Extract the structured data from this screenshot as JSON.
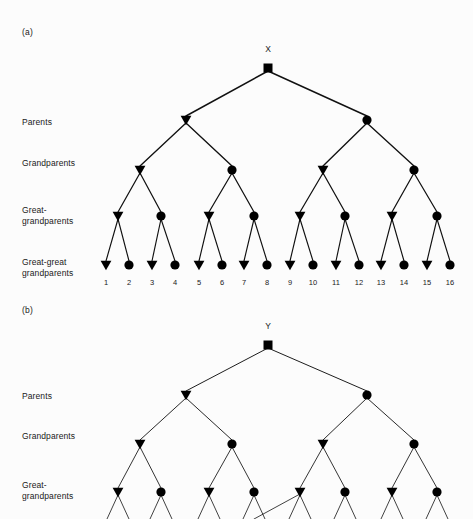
{
  "figure": {
    "background": "#fcfcfc",
    "ink": "#000000",
    "width": 473,
    "height": 519,
    "type": "pedigree-diagram"
  },
  "generation_labels": {
    "parents": "Parents",
    "grandparents": "Grandparents",
    "great_grandparents_line1": "Great-",
    "great_grandparents_line2": "grandparents",
    "great_great_grandparents_line1": "Great-great",
    "great_great_grandparents_line2": "grandparents"
  },
  "symbols": {
    "proband": "square",
    "male": "triangle-down",
    "female": "circle"
  },
  "panel_a": {
    "tag": "(a)",
    "proband_label": "X",
    "leaf_numbers": [
      "1",
      "2",
      "3",
      "4",
      "5",
      "6",
      "7",
      "8",
      "9",
      "10",
      "11",
      "12",
      "13",
      "14",
      "15",
      "16"
    ],
    "levels": [
      {
        "name": "proband",
        "y": 68,
        "nodes": [
          {
            "x": 268,
            "shape": "square"
          }
        ]
      },
      {
        "name": "parents",
        "y": 120,
        "nodes": [
          {
            "x": 186,
            "shape": "triangle"
          },
          {
            "x": 367,
            "shape": "circle"
          }
        ]
      },
      {
        "name": "grandparents",
        "y": 170,
        "nodes": [
          {
            "x": 140,
            "shape": "triangle"
          },
          {
            "x": 232,
            "shape": "circle"
          },
          {
            "x": 323,
            "shape": "triangle"
          },
          {
            "x": 414,
            "shape": "circle"
          }
        ]
      },
      {
        "name": "great-grandparents",
        "y": 216,
        "nodes": [
          {
            "x": 118,
            "shape": "triangle"
          },
          {
            "x": 161,
            "shape": "circle"
          },
          {
            "x": 209,
            "shape": "triangle"
          },
          {
            "x": 254,
            "shape": "circle"
          },
          {
            "x": 300,
            "shape": "triangle"
          },
          {
            "x": 345,
            "shape": "circle"
          },
          {
            "x": 392,
            "shape": "triangle"
          },
          {
            "x": 437,
            "shape": "circle"
          }
        ]
      },
      {
        "name": "great-great-grandparents",
        "y": 265,
        "nodes": [
          {
            "x": 106,
            "shape": "triangle"
          },
          {
            "x": 129,
            "shape": "circle"
          },
          {
            "x": 152,
            "shape": "triangle"
          },
          {
            "x": 175,
            "shape": "circle"
          },
          {
            "x": 199,
            "shape": "triangle"
          },
          {
            "x": 222,
            "shape": "circle"
          },
          {
            "x": 244,
            "shape": "triangle"
          },
          {
            "x": 267,
            "shape": "circle"
          },
          {
            "x": 290,
            "shape": "triangle"
          },
          {
            "x": 313,
            "shape": "circle"
          },
          {
            "x": 336,
            "shape": "triangle"
          },
          {
            "x": 359,
            "shape": "circle"
          },
          {
            "x": 381,
            "shape": "triangle"
          },
          {
            "x": 404,
            "shape": "circle"
          },
          {
            "x": 427,
            "shape": "triangle"
          },
          {
            "x": 450,
            "shape": "circle"
          }
        ]
      }
    ],
    "label_positions": {
      "tag_x": 22,
      "tag_y": 33,
      "parents_y": 118,
      "grandparents_y": 159,
      "great_y": 206,
      "great_great_y": 258,
      "label_x": 22,
      "leaf_number_y": 278
    }
  },
  "panel_b": {
    "tag": "(b)",
    "proband_label": "Y",
    "inbreeding_loop": true,
    "levels": [
      {
        "name": "proband",
        "y": 345,
        "nodes": [
          {
            "x": 268,
            "shape": "square"
          }
        ]
      },
      {
        "name": "parents",
        "y": 395,
        "nodes": [
          {
            "x": 186,
            "shape": "triangle"
          },
          {
            "x": 367,
            "shape": "circle"
          }
        ]
      },
      {
        "name": "grandparents",
        "y": 444,
        "nodes": [
          {
            "x": 140,
            "shape": "triangle"
          },
          {
            "x": 232,
            "shape": "circle"
          },
          {
            "x": 323,
            "shape": "triangle"
          },
          {
            "x": 414,
            "shape": "circle"
          }
        ]
      },
      {
        "name": "great-grandparents",
        "y": 492,
        "nodes": [
          {
            "x": 118,
            "shape": "triangle"
          },
          {
            "x": 161,
            "shape": "circle"
          },
          {
            "x": 209,
            "shape": "triangle"
          },
          {
            "x": 254,
            "shape": "circle"
          },
          {
            "x": 300,
            "shape": "triangle"
          },
          {
            "x": 345,
            "shape": "circle"
          },
          {
            "x": 392,
            "shape": "triangle"
          },
          {
            "x": 437,
            "shape": "circle"
          }
        ]
      }
    ],
    "label_positions": {
      "tag_x": 22,
      "tag_y": 311,
      "parents_y": 392,
      "grandparents_y": 432,
      "great_y": 481,
      "label_x": 22
    }
  }
}
